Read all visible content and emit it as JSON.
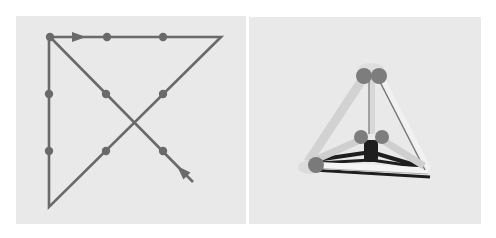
{
  "figure": {
    "panels": [
      {
        "id": "left",
        "description": "Nine-dot puzzle solution: 3x3 grid of dots connected by four straight lines drawn without lifting the pen",
        "colors": {
          "background": "#e9e9e9",
          "stroke": "#6a6a6a",
          "dot": "#6a6a6a"
        },
        "dots": [
          {
            "x": 50,
            "y": 37
          },
          {
            "x": 107,
            "y": 37
          },
          {
            "x": 163,
            "y": 37
          },
          {
            "x": 49,
            "y": 94
          },
          {
            "x": 106,
            "y": 94
          },
          {
            "x": 163,
            "y": 94
          },
          {
            "x": 49,
            "y": 151
          },
          {
            "x": 106,
            "y": 151
          },
          {
            "x": 163,
            "y": 151
          }
        ],
        "path": [
          {
            "x": 193,
            "y": 182
          },
          {
            "x": 50,
            "y": 37
          },
          {
            "x": 221,
            "y": 37
          },
          {
            "x": 49,
            "y": 207
          },
          {
            "x": 49,
            "y": 37
          }
        ],
        "arrows": [
          {
            "x": 79,
            "y": 37,
            "direction": "right"
          },
          {
            "x": 182,
            "y": 171,
            "direction": "up-left"
          }
        ]
      },
      {
        "id": "right",
        "description": "3D tetrahedron built from six sticks joined at four rounded nodes",
        "colors": {
          "background": "#e9e9e9",
          "stick_light": "#d6d6d6",
          "stick_edge": "#9a9a9a",
          "node": "#7d7d7d",
          "shadow": "#1e1e1e"
        },
        "vertices": {
          "top": {
            "x": 371,
            "y": 74
          },
          "left": {
            "x": 310,
            "y": 165
          },
          "right": {
            "x": 430,
            "y": 172
          },
          "back": {
            "x": 371,
            "y": 150
          }
        }
      }
    ]
  }
}
